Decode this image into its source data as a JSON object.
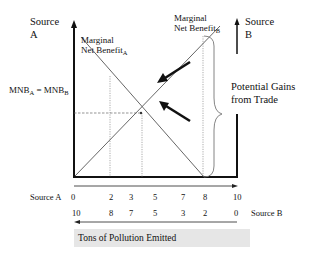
{
  "diagram": {
    "axis_left_label_line1": "Source",
    "axis_left_label_line2": "A",
    "axis_right_label_line1": "Source",
    "axis_right_label_line2": "B",
    "curve_a_label_line1": "Marginal",
    "curve_a_label_line2": "Net Benefit",
    "curve_a_subscript": "A",
    "curve_b_label_line1": "Marginal",
    "curve_b_label_line2": "Net Benefit",
    "curve_b_subscript": "B",
    "equilibrium_label_main_a": "MNB",
    "equilibrium_label_sub_a": "A",
    "equilibrium_label_eq": " = MNB",
    "equilibrium_label_sub_b": "B",
    "brace_label_line1": "Potential Gains",
    "brace_label_line2": "from Trade",
    "source_a_axis_label": "Source A",
    "source_b_axis_label": "Source B",
    "source_a_ticks": [
      "0",
      "2",
      "3",
      "5",
      "7",
      "8",
      "10"
    ],
    "source_b_ticks": [
      "10",
      "8",
      "7",
      "5",
      "3",
      "2",
      "0"
    ],
    "caption": "Tons of Pollution Emitted",
    "colors": {
      "axis": "#111111",
      "curve": "#555555",
      "guide": "#777777",
      "caption_bg": "#e6e6e6"
    }
  }
}
